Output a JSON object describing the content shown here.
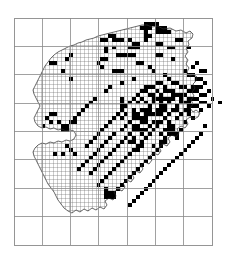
{
  "figure": {
    "name": "distribution-atlas-map",
    "type": "grid-distribution-map",
    "width": 225,
    "height": 263
  },
  "colors": {
    "background": "#ffffff",
    "major_grid": "#8a8a8a",
    "fine_grid": "#707070",
    "outline": "#2b2b2b",
    "presence_fill": "#000000"
  },
  "frame": {
    "x": 14,
    "y": 18,
    "width": 198,
    "height": 227,
    "columns": 7,
    "rows": 8,
    "cell_width": 28.285,
    "cell_height": 28.375,
    "stroke_width": 0.8
  },
  "fine_grid": {
    "cell_size": 3.93,
    "origin_x": 14,
    "origin_y": 18,
    "stroke_width": 0.35,
    "clip_to_outline_bbox": true
  },
  "outline": {
    "stroke_width": 0.7,
    "points": "147,25 152,27 158,26 163,29 170,28 176,31 181,30 186,33 190,31 193,34 192,38 188,41 189,45 186,48 188,52 185,56 188,60 186,64 189,68 187,72 190,76 193,74 197,77 196,81 193,84 195,88 192,92 194,96 191,100 193,104 190,108 193,112 196,110 200,113 198,117 194,119 190,117 186,120 188,124 185,128 181,126 177,129 179,133 176,137 172,135 168,138 170,142 167,146 163,144 159,147 161,151 158,155 154,153 150,156 152,160 149,164 145,162 141,165 143,169 140,173 136,171 132,174 134,178 131,182 127,180 123,183 125,187 122,191 118,189 114,192 116,196 113,200 109,198 105,201 107,205 104,209 100,207 96,210 92,208 88,211 84,209 80,212 76,210 72,213 68,211 64,208 61,204 58,200 56,196 54,192 51,188 48,184 46,180 44,176 42,172 40,168 38,164 36,160 34,156 33,152 35,148 38,145 42,143 46,144 50,142 54,143 58,141 62,142 66,140 70,141 74,139 76,135 74,131 70,130 66,131 62,129 58,130 54,128 50,129 46,127 42,128 38,126 35,122 34,118 36,114 38,110 40,106 38,102 36,98 34,94 33,90 35,86 37,82 39,78 41,74 43,70 45,66 48,62 51,58 54,55 58,52 62,50 66,48 70,46 74,45 78,43 82,42 86,40 90,39 94,38 98,36 102,35 106,34 110,33 114,32 118,31 122,30 126,29 130,28 134,27 138,26 142,25 147,25"
  },
  "land_mask": {
    "comment": "Axis-aligned bounding regions approximating the mapped land area for the fine grid",
    "bbox": {
      "x": 32,
      "y": 24,
      "width": 170,
      "height": 195
    }
  },
  "chart_data": {
    "type": "heatmap",
    "title": "",
    "xlabel": "",
    "ylabel": "",
    "grid": true,
    "legend": null,
    "cell_size_px": 3.93,
    "filled_cell_count": 207,
    "filled_cells": [
      [
        33,
        1
      ],
      [
        34,
        1
      ],
      [
        35,
        1
      ],
      [
        36,
        1
      ],
      [
        32,
        2
      ],
      [
        33,
        2
      ],
      [
        34,
        2
      ],
      [
        36,
        2
      ],
      [
        37,
        2
      ],
      [
        38,
        2
      ],
      [
        33,
        3
      ],
      [
        36,
        3
      ],
      [
        37,
        3
      ],
      [
        38,
        3
      ],
      [
        39,
        3
      ],
      [
        24,
        4
      ],
      [
        25,
        4
      ],
      [
        33,
        4
      ],
      [
        34,
        4
      ],
      [
        22,
        5
      ],
      [
        23,
        5
      ],
      [
        33,
        5
      ],
      [
        41,
        5
      ],
      [
        42,
        5
      ],
      [
        30,
        6
      ],
      [
        31,
        6
      ],
      [
        36,
        6
      ],
      [
        37,
        6
      ],
      [
        29,
        7
      ],
      [
        30,
        7
      ],
      [
        39,
        7
      ],
      [
        40,
        7
      ],
      [
        44,
        7
      ],
      [
        14,
        9
      ],
      [
        26,
        9
      ],
      [
        27,
        9
      ],
      [
        36,
        9
      ],
      [
        37,
        9
      ],
      [
        13,
        10
      ],
      [
        22,
        10
      ],
      [
        23,
        10
      ],
      [
        40,
        10
      ],
      [
        9,
        11
      ],
      [
        10,
        11
      ],
      [
        21,
        11
      ],
      [
        31,
        11
      ],
      [
        32,
        11
      ],
      [
        46,
        11
      ],
      [
        22,
        12
      ],
      [
        34,
        12
      ],
      [
        45,
        12
      ],
      [
        12,
        13
      ],
      [
        26,
        13
      ],
      [
        27,
        13
      ],
      [
        35,
        13
      ],
      [
        43,
        13
      ],
      [
        47,
        13
      ],
      [
        48,
        13
      ],
      [
        25,
        13
      ],
      [
        38,
        14
      ],
      [
        44,
        14
      ],
      [
        45,
        14
      ],
      [
        14,
        15
      ],
      [
        30,
        15
      ],
      [
        39,
        15
      ],
      [
        46,
        15
      ],
      [
        47,
        15
      ],
      [
        27,
        16
      ],
      [
        36,
        16
      ],
      [
        37,
        16
      ],
      [
        40,
        16
      ],
      [
        41,
        16
      ],
      [
        48,
        16
      ],
      [
        24,
        17
      ],
      [
        33,
        17
      ],
      [
        34,
        17
      ],
      [
        35,
        17
      ],
      [
        38,
        17
      ],
      [
        42,
        17
      ],
      [
        43,
        17
      ],
      [
        46,
        17
      ],
      [
        47,
        17
      ],
      [
        23,
        18
      ],
      [
        32,
        18
      ],
      [
        33,
        18
      ],
      [
        36,
        18
      ],
      [
        39,
        18
      ],
      [
        40,
        18
      ],
      [
        44,
        18
      ],
      [
        45,
        18
      ],
      [
        46,
        18
      ],
      [
        49,
        18
      ],
      [
        31,
        19
      ],
      [
        34,
        19
      ],
      [
        35,
        19
      ],
      [
        37,
        19
      ],
      [
        41,
        19
      ],
      [
        42,
        19
      ],
      [
        43,
        19
      ],
      [
        47,
        19
      ],
      [
        48,
        19
      ],
      [
        20,
        20
      ],
      [
        30,
        20
      ],
      [
        32,
        20
      ],
      [
        36,
        20
      ],
      [
        38,
        20
      ],
      [
        40,
        20
      ],
      [
        44,
        20
      ],
      [
        45,
        20
      ],
      [
        46,
        20
      ],
      [
        50,
        20
      ],
      [
        19,
        21
      ],
      [
        29,
        21
      ],
      [
        31,
        21
      ],
      [
        33,
        21
      ],
      [
        37,
        21
      ],
      [
        39,
        21
      ],
      [
        42,
        21
      ],
      [
        43,
        21
      ],
      [
        47,
        21
      ],
      [
        48,
        21
      ],
      [
        52,
        21
      ],
      [
        18,
        22
      ],
      [
        28,
        22
      ],
      [
        34,
        22
      ],
      [
        38,
        22
      ],
      [
        41,
        22
      ],
      [
        44,
        22
      ],
      [
        45,
        22
      ],
      [
        46,
        22
      ],
      [
        49,
        22
      ],
      [
        17,
        23
      ],
      [
        27,
        23
      ],
      [
        30,
        23
      ],
      [
        36,
        23
      ],
      [
        40,
        23
      ],
      [
        43,
        23
      ],
      [
        47,
        23
      ],
      [
        9,
        24
      ],
      [
        10,
        24
      ],
      [
        16,
        24
      ],
      [
        26,
        24
      ],
      [
        35,
        24
      ],
      [
        39,
        24
      ],
      [
        42,
        24
      ],
      [
        44,
        24
      ],
      [
        8,
        25
      ],
      [
        15,
        25
      ],
      [
        25,
        25
      ],
      [
        33,
        25
      ],
      [
        38,
        25
      ],
      [
        41,
        25
      ],
      [
        45,
        25
      ],
      [
        11,
        26
      ],
      [
        14,
        26
      ],
      [
        24,
        26
      ],
      [
        32,
        26
      ],
      [
        37,
        26
      ],
      [
        43,
        26
      ],
      [
        13,
        27
      ],
      [
        23,
        27
      ],
      [
        31,
        27
      ],
      [
        36,
        27
      ],
      [
        40,
        27
      ],
      [
        48,
        27
      ],
      [
        12,
        28
      ],
      [
        22,
        28
      ],
      [
        30,
        28
      ],
      [
        35,
        28
      ],
      [
        42,
        28
      ],
      [
        21,
        29
      ],
      [
        25,
        29
      ],
      [
        29,
        29
      ],
      [
        34,
        29
      ],
      [
        39,
        29
      ],
      [
        47,
        29
      ],
      [
        20,
        30
      ],
      [
        24,
        30
      ],
      [
        28,
        30
      ],
      [
        33,
        30
      ],
      [
        41,
        30
      ],
      [
        46,
        30
      ],
      [
        19,
        31
      ],
      [
        23,
        31
      ],
      [
        27,
        31
      ],
      [
        32,
        31
      ],
      [
        38,
        31
      ],
      [
        45,
        31
      ],
      [
        18,
        32
      ],
      [
        22,
        32
      ],
      [
        26,
        32
      ],
      [
        31,
        32
      ],
      [
        37,
        32
      ],
      [
        44,
        32
      ],
      [
        21,
        33
      ],
      [
        25,
        33
      ],
      [
        30,
        33
      ],
      [
        36,
        33
      ],
      [
        43,
        33
      ],
      [
        12,
        34
      ],
      [
        20,
        34
      ],
      [
        24,
        34
      ],
      [
        29,
        34
      ],
      [
        35,
        34
      ],
      [
        42,
        34
      ],
      [
        19,
        35
      ],
      [
        23,
        35
      ],
      [
        28,
        35
      ],
      [
        34,
        35
      ],
      [
        41,
        35
      ],
      [
        18,
        36
      ],
      [
        22,
        36
      ],
      [
        27,
        36
      ],
      [
        33,
        36
      ],
      [
        40,
        36
      ],
      [
        17,
        37
      ],
      [
        21,
        37
      ],
      [
        26,
        37
      ],
      [
        32,
        37
      ],
      [
        39,
        37
      ],
      [
        16,
        38
      ],
      [
        20,
        38
      ],
      [
        25,
        38
      ],
      [
        31,
        38
      ],
      [
        38,
        38
      ],
      [
        19,
        39
      ],
      [
        24,
        39
      ],
      [
        30,
        39
      ],
      [
        37,
        39
      ],
      [
        23,
        40
      ],
      [
        29,
        40
      ],
      [
        36,
        40
      ],
      [
        22,
        41
      ],
      [
        28,
        41
      ],
      [
        35,
        41
      ],
      [
        21,
        42
      ],
      [
        27,
        42
      ],
      [
        34,
        42
      ],
      [
        26,
        43
      ],
      [
        33,
        43
      ],
      [
        25,
        44
      ],
      [
        32,
        44
      ],
      [
        24,
        45
      ],
      [
        31,
        45
      ],
      [
        30,
        46
      ],
      [
        29,
        47
      ]
    ]
  },
  "dense_clusters": [
    {
      "name": "central-east-cluster",
      "x": 122,
      "y": 96,
      "width": 58,
      "height": 56,
      "density": 0.62
    },
    {
      "name": "south-central-cluster",
      "x": 98,
      "y": 186,
      "width": 52,
      "height": 40,
      "density": 0.55
    },
    {
      "name": "north-central-cluster",
      "x": 106,
      "y": 30,
      "width": 38,
      "height": 26,
      "density": 0.3
    },
    {
      "name": "west-cluster",
      "x": 40,
      "y": 120,
      "width": 36,
      "height": 34,
      "density": 0.22
    },
    {
      "name": "east-edge-cluster",
      "x": 160,
      "y": 85,
      "width": 36,
      "height": 60,
      "density": 0.28
    }
  ]
}
